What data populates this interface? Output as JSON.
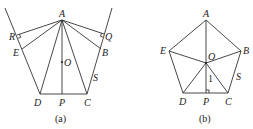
{
  "figures": [
    {
      "caption": "(a)",
      "points": {
        "A": "A",
        "B": "B",
        "C": "C",
        "D": "D",
        "E": "E",
        "O": "O",
        "P": "P",
        "Q": "Q",
        "R": "R",
        "S": "S"
      }
    },
    {
      "caption": "(b)",
      "points": {
        "A": "A",
        "B": "B",
        "C": "C",
        "D": "D",
        "E": "E",
        "O": "O",
        "P": "P",
        "S": "S"
      },
      "segment_label": "1"
    }
  ]
}
